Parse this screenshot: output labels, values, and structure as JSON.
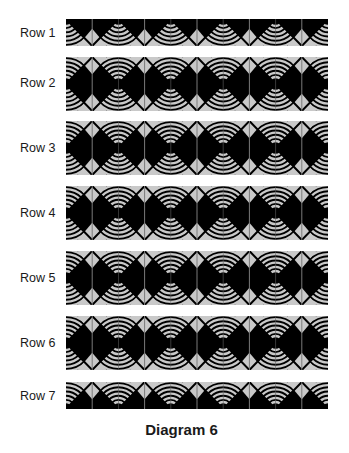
{
  "diagram": {
    "caption": "Diagram 6",
    "colors": {
      "dark": "#000000",
      "light": "#c9c9c9",
      "seam": "#7a7a7a",
      "background": "#ffffff"
    },
    "blocks_per_row": 5,
    "rows": [
      {
        "label": "Row 1",
        "portion": "bottom-half"
      },
      {
        "label": "Row 2",
        "portion": "full"
      },
      {
        "label": "Row 3",
        "portion": "full"
      },
      {
        "label": "Row 4",
        "portion": "full"
      },
      {
        "label": "Row 5",
        "portion": "full"
      },
      {
        "label": "Row 6",
        "portion": "full"
      },
      {
        "label": "Row 7",
        "portion": "top-half"
      }
    ]
  }
}
